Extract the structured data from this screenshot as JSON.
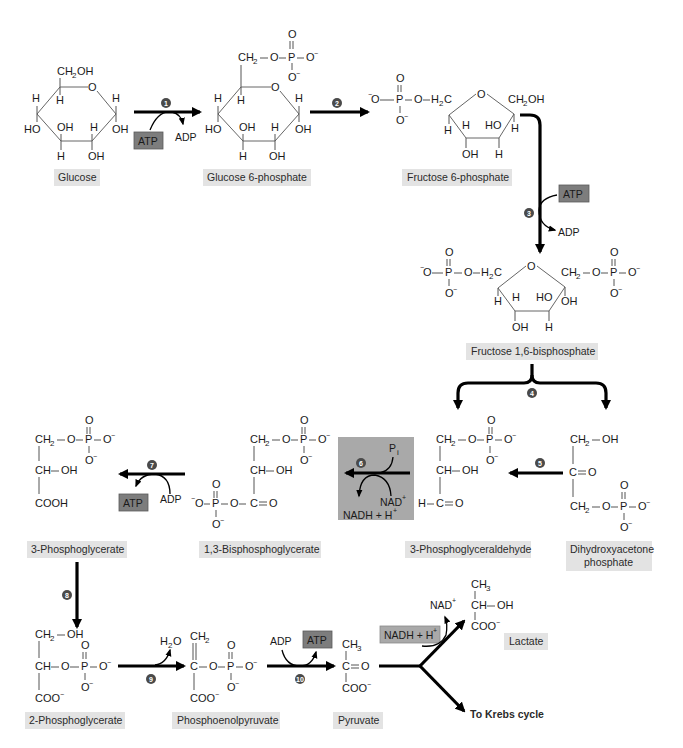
{
  "compounds": {
    "glucose": {
      "label": "Glucose"
    },
    "glucose6p": {
      "label": "Glucose 6-phosphate"
    },
    "fructose6p": {
      "label": "Fructose 6-phosphate"
    },
    "fructose16bp": {
      "label": "Fructose 1,6-bisphosphate"
    },
    "dhap": {
      "label_line1": "Dihydroxyacetone",
      "label_line2": "phosphate"
    },
    "g3p": {
      "label": "3-Phosphoglyceraldehyde"
    },
    "bpg13": {
      "label": "1,3-Bisphosphoglycerate"
    },
    "pg3": {
      "label": "3-Phosphoglycerate"
    },
    "pg2": {
      "label": "2-Phosphoglycerate"
    },
    "pep": {
      "label": "Phosphoenolpyruvate"
    },
    "pyruvate": {
      "label": "Pyruvate"
    },
    "lactate": {
      "label": "Lactate"
    },
    "krebs": {
      "label": "To Krebs cycle"
    }
  },
  "steps": [
    "1",
    "2",
    "3",
    "4",
    "5",
    "6",
    "7",
    "8",
    "9",
    "10"
  ],
  "cofactors": {
    "atp": "ATP",
    "adp": "ADP",
    "nad_plus": "NAD",
    "nadh": "NADH + H",
    "pi": "P",
    "pi_sub": "i",
    "h2o": "H",
    "plus": "+"
  },
  "atoms": {
    "ch2oh": "CH",
    "oh": "OH",
    "ho": "HO",
    "h": "H",
    "o": "O",
    "p": "P",
    "o_minus": "O",
    "minus": "−",
    "two": "2",
    "three": "3",
    "ch2": "CH",
    "h2c": "H",
    "c": "C",
    "ch": "CH",
    "cooh": "COOH",
    "coo": "COO",
    "ch3": "CH"
  },
  "colors": {
    "label_bg": "#e3e3e3",
    "cofactor_box": "#7d7d7d",
    "step6_highlight": "#a9a9a9",
    "step_circle": "#4a4a4a",
    "arrow": "#000000"
  }
}
